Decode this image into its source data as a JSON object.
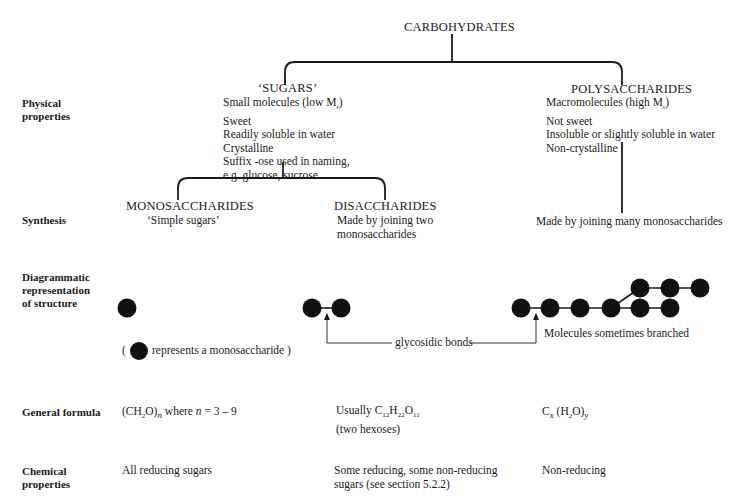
{
  "root": {
    "title": "CARBOHYDRATES"
  },
  "row_labels": {
    "physical": [
      "Physical",
      "properties"
    ],
    "synthesis": "Synthesis",
    "diagram": [
      "Diagrammatic",
      "representation",
      "of structure"
    ],
    "formula": "General formula",
    "chemical": [
      "Chemical",
      "properties"
    ]
  },
  "sugars": {
    "title": "‘SUGARS’",
    "properties": [
      "Small molecules (low M",
      "Sweet",
      "Readily soluble in water",
      "Crystalline",
      "Suffix -ose used in naming,",
      "e.g. glucose, sucrose"
    ],
    "mr_sub": "r",
    "close_paren": ")"
  },
  "polysaccharides": {
    "title": "POLYSACCHARIDES",
    "properties": [
      "Macromolecules (high M",
      "Not sweet",
      "Insoluble or slightly soluble in water",
      "Non-crystalline"
    ],
    "mr_sub": "r",
    "close_paren": ")",
    "synthesis": "Made by joining many monosaccharides",
    "formula_c": "C",
    "formula_x": "x",
    "formula_h2o": " (H",
    "formula_2": "2",
    "formula_o": "O)",
    "formula_y": "y",
    "chemical": "Non-reducing",
    "structure_note": "Molecules sometimes branched"
  },
  "monosaccharides": {
    "title": "MONOSACCHARIDES",
    "synthesis": "‘Simple sugars’",
    "legend_open": "(",
    "legend_text": "represents a monosaccharide )",
    "formula_pre": "(CH",
    "formula_2": "2",
    "formula_o": "O)",
    "formula_n": "n",
    "formula_where": " where ",
    "formula_n2": "n",
    "formula_range": " = 3 – 9",
    "chemical": "All reducing sugars"
  },
  "disaccharides": {
    "title": "DISACCHARIDES",
    "synthesis": [
      "Made by joining two",
      "monosaccharides"
    ],
    "formula_pre": "Usually C",
    "formula_c": "12",
    "formula_h": "H",
    "formula_hn": "22",
    "formula_o": "O",
    "formula_on": "11",
    "formula_note": "(two hexoses)",
    "chemical": [
      "Some reducing, some non-reducing",
      "sugars (see section 5.2.2)"
    ]
  },
  "annotations": {
    "glycosidic": "glycosidic bonds"
  },
  "colors": {
    "ink": "#1a1a1a",
    "background": "#ffffff"
  }
}
